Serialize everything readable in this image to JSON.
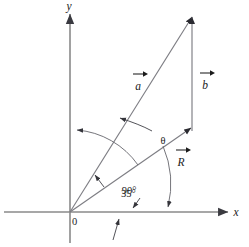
{
  "figure": {
    "kind": "vector-addition-diagram",
    "background_color": "#ffffff",
    "axis_color": "#8a8a8a",
    "vector_color": "#7d7d83",
    "label_color": "#1b1b1b"
  },
  "axes": {
    "x_label": "x",
    "y_label": "y",
    "origin_label": "0"
  },
  "vectors": [
    {
      "id": "a",
      "label": "a",
      "overbar": true,
      "from": "origin",
      "to": "corner"
    },
    {
      "id": "b",
      "label": "b",
      "overbar": true,
      "from": "corner",
      "to": "apex"
    },
    {
      "id": "R",
      "label": "R",
      "overbar": true,
      "from": "origin",
      "to": "apex"
    }
  ],
  "angles": [
    {
      "id": "theta",
      "label": "θ",
      "between": "R-and-a"
    },
    {
      "id": "a-from-x",
      "label": "35°",
      "between": "a-and-x-axis"
    },
    {
      "id": "a-to-b",
      "label": "90°",
      "between": "a-and-b"
    }
  ],
  "annotations": {
    "arc_to_y_axis": "arrow-to-y-axis",
    "arrow_below_x_axis": "arrow-up-to-x-axis",
    "arrow_to_35_vertex": "arrow-to-angle-vertex"
  }
}
